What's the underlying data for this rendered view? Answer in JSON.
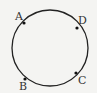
{
  "diagram": {
    "type": "circle-with-points",
    "background": "#f4f4f2",
    "stroke_color": "#222222",
    "circle": {
      "cx": 50,
      "cy": 48,
      "r": 38
    },
    "points": [
      {
        "label": "A",
        "x": 24,
        "y": 23,
        "label_x": 15,
        "label_y": 20
      },
      {
        "label": "D",
        "x": 77,
        "y": 28,
        "label_x": 78,
        "label_y": 24
      },
      {
        "label": "B",
        "x": 25,
        "y": 79,
        "label_x": 19,
        "label_y": 90
      },
      {
        "label": "C",
        "x": 76,
        "y": 73,
        "label_x": 78,
        "label_y": 84
      }
    ]
  }
}
